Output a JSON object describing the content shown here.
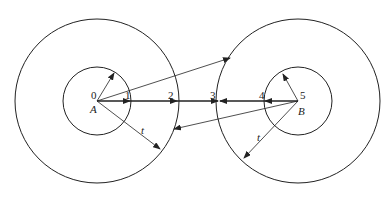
{
  "diagram": {
    "circleA": {
      "center_label": "A",
      "center": [
        97,
        101
      ],
      "inner_radius": 34,
      "outer_radius": 82
    },
    "circleB": {
      "center_label": "B",
      "center": [
        298,
        101
      ],
      "inner_radius": 34,
      "outer_radius": 82
    },
    "points": [
      {
        "label": "0",
        "x": 93,
        "y": 98
      },
      {
        "label": "1",
        "x": 126,
        "y": 99
      },
      {
        "label": "2",
        "x": 170,
        "y": 99
      },
      {
        "label": "3",
        "x": 213,
        "y": 99
      },
      {
        "label": "4",
        "x": 262,
        "y": 99
      },
      {
        "label": "5",
        "x": 301,
        "y": 98
      }
    ],
    "thickness_label": "t",
    "stroke_color": "#222222"
  }
}
